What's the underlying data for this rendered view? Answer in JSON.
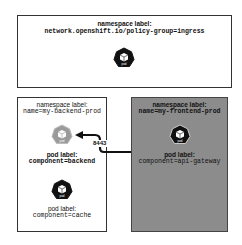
{
  "ingress_namespace": {
    "heading": "namespace label:",
    "label": "network.openshift.io/policy-group=ingress",
    "pod_icon_text": "pod"
  },
  "backend_namespace": {
    "heading": "namespace label:",
    "label": "name=my-backend-prod",
    "pods": [
      {
        "icon_text": "pod",
        "heading": "pod label:",
        "label": "component=backend",
        "style": "highlighted-gray"
      },
      {
        "icon_text": "pod",
        "heading": "pod label:",
        "label": "component=cache",
        "style": "dark"
      }
    ]
  },
  "frontend_namespace": {
    "heading": "namespace label:",
    "label": "name=my-frontend-prod",
    "pod": {
      "icon_text": "pod",
      "heading": "pod label:",
      "label": "component=api-gateway"
    }
  },
  "connection": {
    "port": "8443",
    "from": "component=api-gateway",
    "to": "component=backend"
  },
  "colors": {
    "frontend_fill": "#8c8c8c",
    "backend_pod": "#9a9a9a",
    "dark_pod": "#111111",
    "border": "#333333"
  }
}
